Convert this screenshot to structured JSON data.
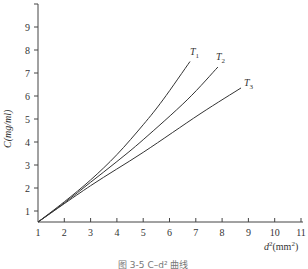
{
  "chart_data": {
    "type": "line",
    "title": "",
    "xlabel": "d²(mm²)",
    "ylabel": "C(mg/ml)",
    "xlim": [
      1,
      11
    ],
    "ylim": [
      0.5,
      10
    ],
    "x_ticks": [
      "1",
      "2",
      "3",
      "4",
      "5",
      "6",
      "7",
      "8",
      "9",
      "10",
      "11"
    ],
    "y_ticks": [
      "1",
      "2",
      "3",
      "4",
      "5",
      "6",
      "7",
      "8",
      "9"
    ],
    "grid": false,
    "legend": "inline labels at curve ends",
    "series": [
      {
        "name": "T1",
        "x": [
          1,
          2,
          3,
          4,
          5,
          5.75,
          6.78
        ],
        "y": [
          0.52,
          1.4,
          2.35,
          3.45,
          4.75,
          5.83,
          7.5
        ]
      },
      {
        "name": "T2",
        "x": [
          1,
          2,
          3,
          4,
          5,
          6.67,
          7.84
        ],
        "y": [
          0.52,
          1.35,
          2.25,
          3.15,
          4.1,
          5.83,
          7.26
        ]
      },
      {
        "name": "T3",
        "x": [
          1,
          3,
          5,
          7.16,
          8.72
        ],
        "y": [
          0.52,
          2.1,
          3.55,
          5.22,
          6.35
        ]
      }
    ]
  },
  "labels": {
    "y_axis": "C(mg/ml)",
    "x_axis_d": "d",
    "x_axis_sup": "2",
    "x_axis_unit": "(mm",
    "x_axis_unit_sup": "2",
    "x_axis_close": ")",
    "t1": "T",
    "t1_sub": "1",
    "t2": "T",
    "t2_sub": "2",
    "t3": "T",
    "t3_sub": "3",
    "caption": "图 3-5  C–d² 曲线"
  }
}
